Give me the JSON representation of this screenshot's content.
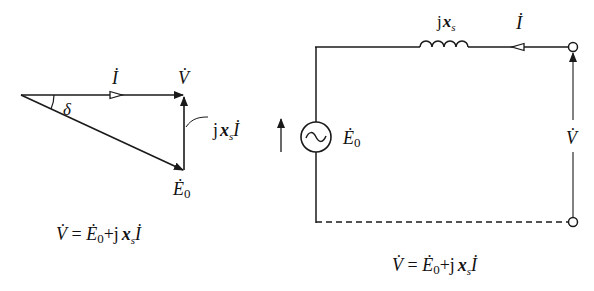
{
  "phasor_diagram": {
    "labels": {
      "current": "İ",
      "voltage": "V̇",
      "angle": "δ",
      "reactance_drop_j": "j",
      "reactance_drop_x": "x",
      "reactance_drop_sub": "s",
      "reactance_drop_i": "İ",
      "emf": "Ė",
      "emf_sub": "0"
    },
    "equation": {
      "lhs": "V̇",
      "eq": " = ",
      "e": "Ė",
      "e_sub": "0",
      "plus": "+j",
      "x": "x",
      "x_sub": "s",
      "i": "İ"
    }
  },
  "circuit_diagram": {
    "labels": {
      "inductor_j": "j",
      "inductor_x": "x",
      "inductor_sub": "s",
      "current": "İ",
      "source_symbol": "~",
      "emf": "Ė",
      "emf_sub": "0",
      "terminal_voltage": "V̇"
    },
    "equation": {
      "lhs": "V̇",
      "eq": " = ",
      "e": "Ė",
      "e_sub": "0",
      "plus": "+j",
      "x": "x",
      "x_sub": "s",
      "i": "İ"
    }
  },
  "colors": {
    "line": "#1a1a1a",
    "background": "#ffffff"
  }
}
